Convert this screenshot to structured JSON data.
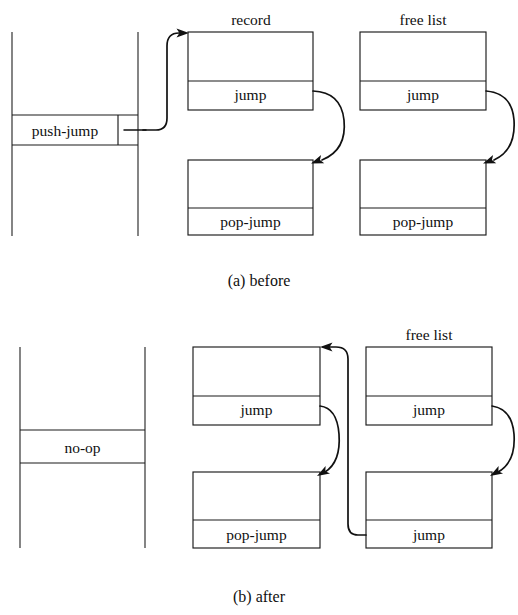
{
  "figure": {
    "ink_color": "#111111",
    "background_color": "#ffffff"
  },
  "panels": [
    {
      "id": "before",
      "caption": "(a) before",
      "code_column": {
        "cell_label": "push-jump",
        "has_pointer_field": true
      },
      "headings": {
        "record": "record",
        "free_list": "free list"
      },
      "record_nodes": [
        {
          "tag": "record-node-top",
          "label": "jump"
        },
        {
          "tag": "record-node-bottom",
          "label": "pop-jump"
        }
      ],
      "free_list_nodes": [
        {
          "tag": "freelist-node-top",
          "label": "jump"
        },
        {
          "tag": "freelist-node-bottom",
          "label": "pop-jump"
        }
      ]
    },
    {
      "id": "after",
      "caption": "(b) after",
      "code_column": {
        "cell_label": "no-op",
        "has_pointer_field": false
      },
      "headings": {
        "record": "",
        "free_list": "free list"
      },
      "record_nodes": [
        {
          "tag": "record-node-top",
          "label": "jump"
        },
        {
          "tag": "record-node-bottom",
          "label": "pop-jump"
        }
      ],
      "free_list_nodes": [
        {
          "tag": "freelist-node-top",
          "label": "jump"
        },
        {
          "tag": "freelist-node-bottom",
          "label": "jump"
        }
      ]
    }
  ]
}
